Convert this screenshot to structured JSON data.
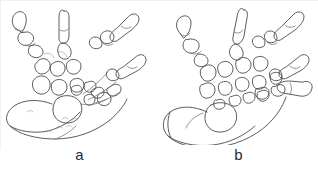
{
  "figure": {
    "width_px": 318,
    "height_px": 177,
    "background_color": "#ffffff",
    "line_color": "#4a4a4f",
    "label_color": "#2a2a2a",
    "panels": [
      {
        "id": "a",
        "label": "a",
        "subject": "limb-skeleton-line-drawing",
        "description": "Line drawing of a hand/forelimb skeleton: five digits with phalanges, metacarpals, rounded carpal elements and a soft fleshy outline of the wrist and forearm.",
        "digit_count": 5,
        "orientation": "digits spread upward and to the right, forearm extending to the lower left"
      },
      {
        "id": "b",
        "label": "b",
        "subject": "limb-skeleton-line-drawing",
        "description": "Line drawing of a hand/forelimb skeleton: five digits with phalanges, metacarpals, a dense cluster of rounded carpal elements and a broad fleshy outline of the wrist and forearm.",
        "digit_count": 5,
        "orientation": "digits spread upward and to the right, forearm extending to the lower left"
      }
    ]
  }
}
